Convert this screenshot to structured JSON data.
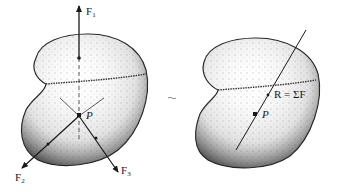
{
  "figure": {
    "left_panel": {
      "description": "Rigid body acted on by three concurrent forces through point P",
      "point_label": "P",
      "forces": [
        {
          "name": "F",
          "subscript": "1",
          "direction": "up"
        },
        {
          "name": "F",
          "subscript": "2",
          "direction": "down-left"
        },
        {
          "name": "F",
          "subscript": "3",
          "direction": "down-right"
        }
      ]
    },
    "equivalence_symbol": "~",
    "right_panel": {
      "description": "Equivalent body with single resultant line of action through P",
      "point_label": "P",
      "resultant_label": "R = ΣF"
    },
    "colors": {
      "ink": "#1a1a1a",
      "stipple": "#333333",
      "background": "#ffffff"
    }
  }
}
